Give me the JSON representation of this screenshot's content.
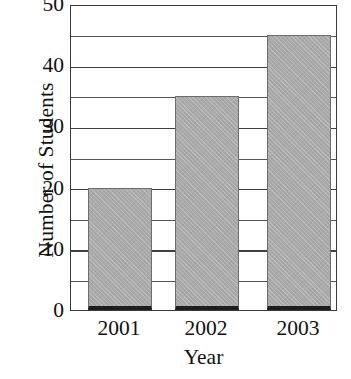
{
  "chart_data": {
    "type": "bar",
    "title": "",
    "categories": [
      "2001",
      "2002",
      "2003"
    ],
    "values": [
      20,
      35,
      45
    ],
    "series": [
      {
        "name": "Number of Students",
        "values": [
          20,
          35,
          45
        ]
      }
    ],
    "xlabel": "Year",
    "ylabel": "Number of Students",
    "ylim": [
      0,
      50
    ],
    "yticks": [
      0,
      10,
      20,
      30,
      40,
      50
    ],
    "ytick_labels": [
      "0",
      "10",
      "20",
      "30",
      "40",
      "50"
    ],
    "y_minor_step": 5,
    "grid": "horizontal",
    "legend": "none",
    "bar_color": "#a9a9a9",
    "bar_edge_color": "#6d6d6d",
    "axis_color": "#3a3a3a"
  },
  "axis": {
    "y_title": "Number of Students",
    "x_title": "Year"
  }
}
